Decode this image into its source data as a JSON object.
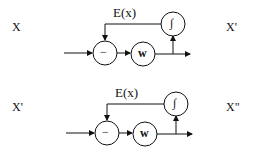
{
  "diagram": {
    "rows": [
      {
        "input_label": "X",
        "output_label": "X'",
        "feedback_label": "E(x)",
        "nodes": {
          "subtract": "−",
          "weight": "w",
          "integral": "∫"
        }
      },
      {
        "input_label": "X'",
        "output_label": "X\"",
        "feedback_label": "E(x)",
        "nodes": {
          "subtract": "−",
          "weight": "w",
          "integral": "∫"
        }
      }
    ]
  }
}
